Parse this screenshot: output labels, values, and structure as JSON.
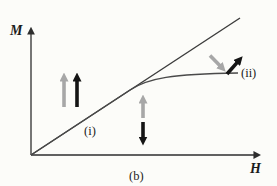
{
  "figure": {
    "axis": {
      "y_label": "M",
      "x_label": "H"
    },
    "labels": {
      "line": "(i)",
      "curve": "(ii)",
      "caption": "(b)"
    },
    "colors": {
      "background": "#fcfcf9",
      "axis": "#2e2e2e",
      "line": "#3c3c3c",
      "curve": "#4a4a4a",
      "arrow_gray": "#a7a7a7",
      "arrow_black": "#151515",
      "text": "#1c1c1c"
    },
    "moment_arrows": [
      {
        "group": "left-low-field",
        "color": "gray",
        "direction": "up"
      },
      {
        "group": "left-low-field",
        "color": "black",
        "direction": "up"
      },
      {
        "group": "middle",
        "color": "gray",
        "direction": "up"
      },
      {
        "group": "middle",
        "color": "black",
        "direction": "down"
      },
      {
        "group": "right-saturation",
        "color": "gray",
        "direction": "down-right"
      },
      {
        "group": "right-saturation",
        "color": "black",
        "direction": "up-right"
      }
    ]
  }
}
